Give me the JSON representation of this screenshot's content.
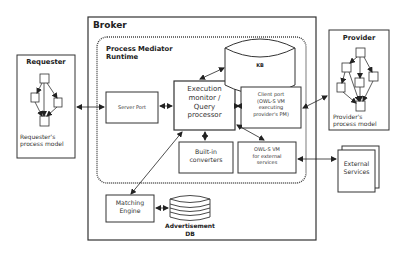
{
  "diagram": {
    "broker": {
      "title": "Broker"
    },
    "runtime": {
      "title_line1": "Process Mediator",
      "title_line2": "Runtime"
    },
    "requester": {
      "title": "Requester",
      "caption_line1": "Requester's",
      "caption_line2": "process model"
    },
    "provider": {
      "title": "Provider",
      "caption_line1": "Provider's",
      "caption_line2": "process model"
    },
    "server_port": {
      "label": "Server Port"
    },
    "exec_monitor": {
      "line1": "Execution",
      "line2": "monitor /",
      "line3": "Query",
      "line4": "processor"
    },
    "kb": {
      "label": "KB"
    },
    "client_port": {
      "line1": "Client port",
      "line2": "(OWL-S VM",
      "line3": "executing",
      "line4": "provider's PM)"
    },
    "converters": {
      "line1": "Built-in",
      "line2": "converters"
    },
    "owls_vm": {
      "line1": "OWL-S VM",
      "line2": "for external",
      "line3": "services"
    },
    "external_services": {
      "line1": "External",
      "line2": "Services"
    },
    "matching_engine": {
      "line1": "Matching",
      "line2": "Engine"
    },
    "adv_db": {
      "line1": "Advertisement",
      "line2": "DB"
    },
    "colors": {
      "stroke": "#333333",
      "background": "#ffffff"
    }
  }
}
